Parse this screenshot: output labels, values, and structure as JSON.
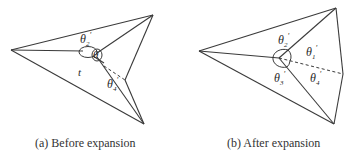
{
  "figure_a": {
    "caption": "(a) Before expansion",
    "labels": {
      "theta2": "θ",
      "theta2_sub": "2",
      "theta1": "θ",
      "theta1_sub": "1",
      "theta4": "θ",
      "theta4_sub": "4",
      "prime": "'",
      "t_label": "t"
    }
  },
  "figure_b": {
    "caption": "(b) After expansion",
    "labels": {
      "theta1": "θ",
      "theta1_sub": "1",
      "theta2": "θ",
      "theta2_sub": "2",
      "theta3": "θ",
      "theta3_sub": "3",
      "theta4": "θ",
      "theta4_sub": "4",
      "prime": "'"
    }
  },
  "colors": {
    "stroke": "#3a3a3a",
    "text": "#2a2a2a",
    "background": "#ffffff"
  }
}
